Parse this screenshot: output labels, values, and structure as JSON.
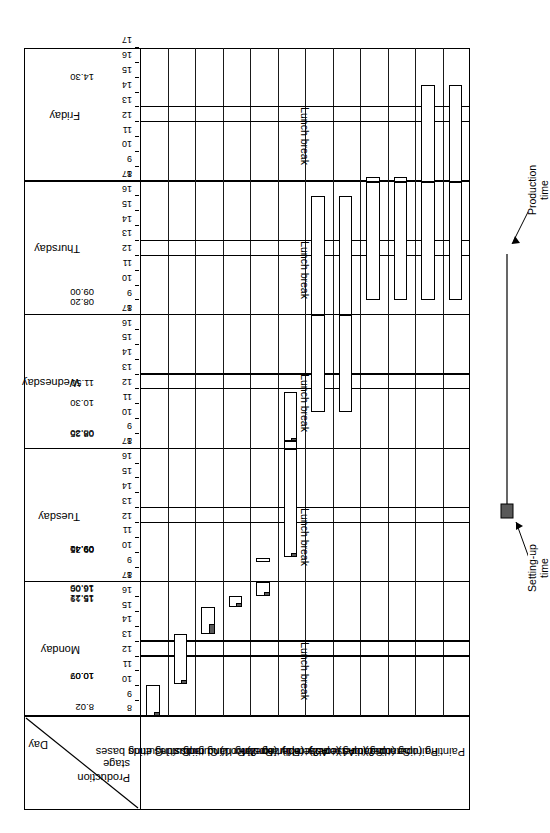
{
  "chart_data": {
    "type": "bar",
    "chart_kind": "gantt",
    "title": "",
    "xlabel": "",
    "ylabel": "",
    "orientation": "rotated-90",
    "header": {
      "day_label": "Day",
      "stage_label_line1": "Production",
      "stage_label_line2": "stage"
    },
    "days": [
      "Monday",
      "Tuesday",
      "Wednesday",
      "Thursday",
      "Friday"
    ],
    "hour_ticks": [
      "8",
      "9",
      "10",
      "11",
      "12",
      "13",
      "14",
      "15",
      "16",
      "17"
    ],
    "axis_range_per_day": [
      8,
      17
    ],
    "lunch_break_label": "Lunch break",
    "lunch_break_range": [
      12,
      13
    ],
    "grid": false,
    "categories": [
      "Cutting bases",
      "Cutting ends",
      "Cutting sides",
      "Routing radius",
      "Routing hand grips",
      "Routing slot",
      "Assembly (operator 1)",
      "Assembly (operator 2)",
      "Sanding (operator 1)",
      "Sanding (operator 2)",
      "Painting (operator 1)",
      "Painting (operator 2)"
    ],
    "legend": {
      "position": "bottom",
      "entries": [
        {
          "name": "Setting-up time",
          "label_line1": "Setting-up",
          "label_line2": "time",
          "fill": "#595959"
        },
        {
          "name": "Production time",
          "label_line1": "Production",
          "label_line2": "time",
          "fill": "#ffffff"
        }
      ]
    },
    "annotations": [
      {
        "text": "8.02",
        "day": "Monday",
        "hour": 8.03
      },
      {
        "text": "10.07",
        "day": "Monday",
        "hour": 10.12
      },
      {
        "text": "10.09",
        "day": "Monday",
        "hour": 10.15
      },
      {
        "text": "15.19",
        "day": "Monday",
        "hour": 15.32
      },
      {
        "text": "15.21",
        "day": "Monday",
        "hour": 15.35
      },
      {
        "text": "16.00",
        "day": "Monday",
        "hour": 16.0
      },
      {
        "text": "16.05",
        "day": "Monday",
        "hour": 16.08
      },
      {
        "text": "09.35",
        "day": "Tuesday",
        "hour": 9.58
      },
      {
        "text": "09.40",
        "day": "Tuesday",
        "hour": 9.67
      },
      {
        "text": "09.41",
        "day": "Tuesday",
        "hour": 9.68
      },
      {
        "text": "08.25",
        "day": "Wednesday",
        "hour": 8.42
      },
      {
        "text": "08.30",
        "day": "Wednesday",
        "hour": 8.5
      },
      {
        "text": "10.30",
        "day": "Wednesday",
        "hour": 10.5
      },
      {
        "text": "11.50",
        "day": "Wednesday",
        "hour": 11.83
      },
      {
        "text": "08.20",
        "day": "Thursday",
        "hour": 8.33
      },
      {
        "text": "09.00",
        "day": "Thursday",
        "hour": 9.0
      },
      {
        "text": "14.30",
        "day": "Friday",
        "hour": 14.5
      }
    ],
    "tasks": [
      {
        "stage": "Cutting bases",
        "day": "Monday",
        "setup_start": 8.0,
        "prod_start": 8.3,
        "prod_end": 10.12
      },
      {
        "stage": "Cutting ends",
        "day": "Monday",
        "setup_start": 10.15,
        "prod_start": 10.45,
        "prod_end": 13.55
      },
      {
        "stage": "Cutting sides",
        "day": "Monday",
        "setup_start": 13.55,
        "prod_start": 14.2,
        "prod_end": 15.32
      },
      {
        "stage": "Routing radius",
        "day": "Monday",
        "setup_start": 15.35,
        "prod_start": 15.6,
        "prod_end": 16.08
      },
      {
        "stage": "Routing hand grips",
        "day": "Monday",
        "setup_start": 16.08,
        "prod_start": 16.35,
        "prod_end": 17.0
      },
      {
        "stage": "Routing hand grips",
        "day": "Tuesday",
        "setup_start": 9.4,
        "prod_start": 9.4,
        "prod_end": 9.67
      },
      {
        "stage": "Routing slot",
        "day": "Tuesday",
        "setup_start": 9.68,
        "prod_start": 10.0,
        "prod_end": 17.0
      },
      {
        "stage": "Routing slot",
        "day": "Wednesday",
        "setup_start": 8.0,
        "prod_start": 8.0,
        "prod_end": 8.5
      },
      {
        "stage": "Routing slot",
        "day": "Wednesday",
        "setup_start": 8.5,
        "prod_start": 8.6,
        "prod_end": 11.83
      },
      {
        "stage": "Assembly (operator 1)",
        "day": "Wednesday",
        "setup_start": 10.5,
        "prod_start": 10.5,
        "prod_end": 17.0
      },
      {
        "stage": "Assembly (operator 1)",
        "day": "Thursday",
        "setup_start": 8.0,
        "prod_start": 8.0,
        "prod_end": 16.0
      },
      {
        "stage": "Assembly (operator 2)",
        "day": "Wednesday",
        "setup_start": 10.5,
        "prod_start": 10.5,
        "prod_end": 17.0
      },
      {
        "stage": "Assembly (operator 2)",
        "day": "Thursday",
        "setup_start": 8.0,
        "prod_start": 8.0,
        "prod_end": 16.0
      },
      {
        "stage": "Sanding (operator 1)",
        "day": "Thursday",
        "setup_start": 9.0,
        "prod_start": 9.0,
        "prod_end": 17.0
      },
      {
        "stage": "Sanding (operator 1)",
        "day": "Friday",
        "setup_start": 8.0,
        "prod_start": 8.0,
        "prod_end": 8.33
      },
      {
        "stage": "Sanding (operator 2)",
        "day": "Thursday",
        "setup_start": 9.0,
        "prod_start": 9.0,
        "prod_end": 17.0
      },
      {
        "stage": "Sanding (operator 2)",
        "day": "Friday",
        "setup_start": 8.0,
        "prod_start": 8.0,
        "prod_end": 8.33
      },
      {
        "stage": "Painting (operator 1)",
        "day": "Thursday",
        "setup_start": 9.0,
        "prod_start": 9.0,
        "prod_end": 17.0
      },
      {
        "stage": "Painting (operator 1)",
        "day": "Friday",
        "setup_start": 8.0,
        "prod_start": 8.0,
        "prod_end": 14.5
      },
      {
        "stage": "Painting (operator 2)",
        "day": "Thursday",
        "setup_start": 9.0,
        "prod_start": 9.0,
        "prod_end": 17.0
      },
      {
        "stage": "Painting (operator 2)",
        "day": "Friday",
        "setup_start": 8.0,
        "prod_start": 8.0,
        "prod_end": 14.5
      }
    ]
  }
}
